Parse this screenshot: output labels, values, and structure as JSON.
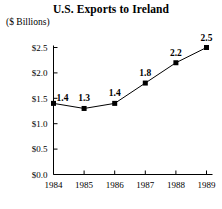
{
  "chart_data": {
    "type": "line",
    "title": "U.S. Exports to Ireland",
    "subtitle": "($ Billions)",
    "xlabel": "",
    "ylabel": "($ Billions)",
    "categories": [
      "1984",
      "1985",
      "1986",
      "1987",
      "1988",
      "1989"
    ],
    "values": [
      1.4,
      1.3,
      1.4,
      1.8,
      2.2,
      2.5
    ],
    "point_labels": [
      "1.4",
      "1.3",
      "1.4",
      "1.8",
      "2.2",
      "2.5"
    ],
    "ylim": [
      0.0,
      2.5
    ],
    "y_ticks": [
      0.0,
      0.5,
      1.0,
      1.5,
      2.0,
      2.5
    ],
    "y_tick_labels": [
      "$0.0",
      "$0.5",
      "$1.0",
      "$1.5",
      "$2.0",
      "$2.5"
    ],
    "grid": false,
    "legend": null,
    "marker": "filled-square",
    "line_color": "#000000",
    "marker_color": "#000000",
    "axis_color": "#000000",
    "background_color": "#ffffff"
  }
}
